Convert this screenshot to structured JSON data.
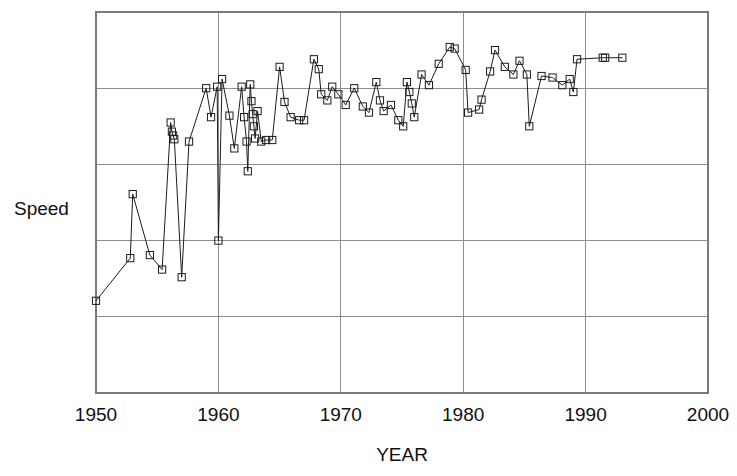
{
  "chart_data": {
    "type": "scatter",
    "title": "",
    "xlabel": "YEAR",
    "ylabel": "Speed",
    "xlim": [
      1950,
      2000
    ],
    "ylim": [
      0,
      5
    ],
    "grid": true,
    "legend": null,
    "x_ticks": [
      1950,
      1960,
      1970,
      1980,
      1990,
      2000
    ],
    "x_tick_labels": [
      "1950",
      "1960",
      "1970",
      "1980",
      "1990",
      "2000"
    ],
    "y_ticks": [
      1,
      2,
      3,
      4
    ],
    "y_tick_labels": [
      "",
      "",
      "",
      ""
    ],
    "marker_style": "open-square",
    "line_style": "solid",
    "series": [
      {
        "name": "Speed",
        "points": [
          [
            1950.0,
            1.21
          ],
          [
            1952.8,
            1.77
          ],
          [
            1953.0,
            2.61
          ],
          [
            1954.4,
            1.81
          ],
          [
            1955.4,
            1.62
          ],
          [
            1956.1,
            3.55
          ],
          [
            1956.2,
            3.43
          ],
          [
            1956.3,
            3.38
          ],
          [
            1956.4,
            3.33
          ],
          [
            1957.0,
            1.52
          ],
          [
            1957.6,
            3.3
          ],
          [
            1959.0,
            4.0
          ],
          [
            1959.4,
            3.62
          ],
          [
            1959.9,
            4.02
          ],
          [
            1960.0,
            2.0
          ],
          [
            1960.3,
            4.12
          ],
          [
            1960.9,
            3.64
          ],
          [
            1961.3,
            3.21
          ],
          [
            1961.9,
            4.02
          ],
          [
            1962.1,
            3.62
          ],
          [
            1962.3,
            3.3
          ],
          [
            1962.4,
            2.91
          ],
          [
            1962.6,
            4.05
          ],
          [
            1962.7,
            3.83
          ],
          [
            1962.8,
            3.66
          ],
          [
            1962.9,
            3.5
          ],
          [
            1963.0,
            3.34
          ],
          [
            1963.2,
            3.7
          ],
          [
            1963.5,
            3.3
          ],
          [
            1963.9,
            3.32
          ],
          [
            1964.4,
            3.32
          ],
          [
            1965.0,
            4.28
          ],
          [
            1965.4,
            3.82
          ],
          [
            1965.9,
            3.62
          ],
          [
            1966.6,
            3.58
          ],
          [
            1967.0,
            3.58
          ],
          [
            1967.8,
            4.38
          ],
          [
            1968.2,
            4.25
          ],
          [
            1968.4,
            3.92
          ],
          [
            1968.9,
            3.84
          ],
          [
            1969.3,
            4.02
          ],
          [
            1969.8,
            3.92
          ],
          [
            1970.4,
            3.78
          ],
          [
            1971.1,
            4.0
          ],
          [
            1971.8,
            3.76
          ],
          [
            1972.3,
            3.68
          ],
          [
            1972.9,
            4.08
          ],
          [
            1973.2,
            3.84
          ],
          [
            1973.5,
            3.7
          ],
          [
            1974.1,
            3.78
          ],
          [
            1974.7,
            3.58
          ],
          [
            1975.1,
            3.5
          ],
          [
            1975.4,
            4.08
          ],
          [
            1975.6,
            3.95
          ],
          [
            1975.8,
            3.8
          ],
          [
            1976.0,
            3.62
          ],
          [
            1976.6,
            4.18
          ],
          [
            1977.2,
            4.04
          ],
          [
            1978.0,
            4.32
          ],
          [
            1978.9,
            4.54
          ],
          [
            1979.3,
            4.52
          ],
          [
            1980.2,
            4.24
          ],
          [
            1980.4,
            3.68
          ],
          [
            1981.3,
            3.72
          ],
          [
            1981.5,
            3.85
          ],
          [
            1982.2,
            4.22
          ],
          [
            1982.6,
            4.5
          ],
          [
            1983.4,
            4.28
          ],
          [
            1984.1,
            4.18
          ],
          [
            1984.6,
            4.36
          ],
          [
            1985.2,
            4.18
          ],
          [
            1985.4,
            3.5
          ],
          [
            1986.4,
            4.16
          ],
          [
            1987.3,
            4.14
          ],
          [
            1988.1,
            4.04
          ],
          [
            1988.7,
            4.12
          ],
          [
            1989.0,
            3.95
          ],
          [
            1989.3,
            4.38
          ],
          [
            1991.4,
            4.4
          ],
          [
            1991.6,
            4.4
          ],
          [
            1993.0,
            4.4
          ]
        ]
      }
    ]
  },
  "axes": {
    "x_title": "YEAR",
    "y_title": "Speed"
  }
}
